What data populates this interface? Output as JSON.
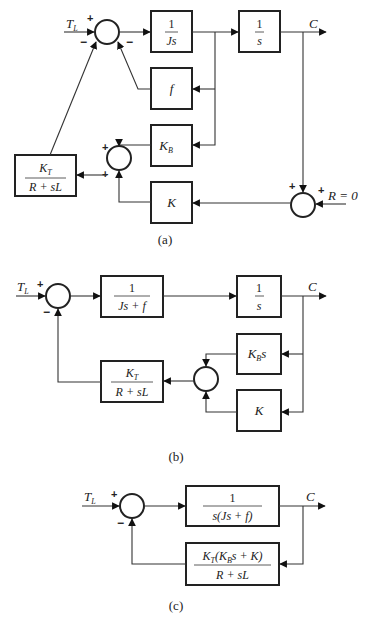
{
  "figure": {
    "a": {
      "caption": "(a)",
      "input_label": "T",
      "input_sub": "L",
      "output_label": "C",
      "reference_label": "R = 0",
      "sum1_signs": [
        "+",
        "−",
        "−"
      ],
      "sum2_signs": [
        "+",
        "+"
      ],
      "sum3_signs": [
        "+",
        "+"
      ],
      "blocks": {
        "inertia": {
          "num": "1",
          "den": "Js"
        },
        "integrator": {
          "num": "1",
          "den": "s"
        },
        "friction": {
          "text": "f"
        },
        "back_emf": {
          "main": "K",
          "sub": "B"
        },
        "motor": {
          "num_main": "K",
          "num_sub": "T",
          "den": "R + sL"
        },
        "gain": {
          "text": "K"
        }
      }
    },
    "b": {
      "caption": "(b)",
      "input_label": "T",
      "input_sub": "L",
      "output_label": "C",
      "sum1_signs": [
        "+",
        "−"
      ],
      "blocks": {
        "forward": {
          "num": "1",
          "den": "Js + f"
        },
        "integrator": {
          "num": "1",
          "den": "s"
        },
        "back_emf": {
          "main": "K",
          "sub": "B",
          "tail": "s"
        },
        "motor": {
          "num_main": "K",
          "num_sub": "T",
          "den": "R + sL"
        },
        "gain": {
          "text": "K"
        }
      }
    },
    "c": {
      "caption": "(c)",
      "input_label": "T",
      "input_sub": "L",
      "output_label": "C",
      "sum1_signs": [
        "+",
        "−"
      ],
      "blocks": {
        "forward": {
          "num": "1",
          "den": "s(Js + f)"
        },
        "feedback": {
          "num_main": "K",
          "num_sub": "T",
          "num_mid": "(K",
          "num_sub2": "B",
          "num_tail": "s + K)",
          "den": "R + sL"
        }
      }
    }
  }
}
